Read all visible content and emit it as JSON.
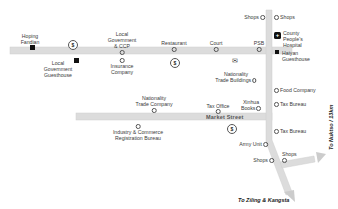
{
  "colors": {
    "road": "#dcdcdc",
    "road_border": "#c8c8c8",
    "text": "#3a3a3a",
    "symbol": "#111111"
  },
  "streets": {
    "market_street": "Market Street"
  },
  "destinations": {
    "east": "To Nuktso / 13km",
    "south": "To Ziling & Kangsta"
  },
  "places": {
    "hoping_fandian": "Hoping\nFandian",
    "local_gov_guesthouse": "Local\nGovernment\nGuesthouse",
    "local_gov_ccp": "Local\nGovernment\n& CCP",
    "insurance_company": "Insurance\nCompany",
    "restaurant": "Restaurant",
    "court": "Court",
    "psb": "PSB",
    "shops_top_left": "Shops",
    "shops_top_right": "Shops",
    "county_hospital": "County\nPeople's\nHospital",
    "haiyan_guesthouse": "Haiyan\nGuesthouse",
    "nationality_trade_buildings": "Nationality\nTrade Buildings",
    "food_company": "Food Company",
    "nationality_trade_company": "Nationality\nTrade Company",
    "tax_office": "Tax Office",
    "xinhua_books": "Xinhua\nBooks",
    "tax_bureau_1": "Tax Bureau",
    "tax_bureau_2": "Tax Bureau",
    "industry_commerce": "Industry & Commerce\nRegistration Bureau",
    "army_unit": "Army Unit",
    "shops_bottom_left": "Shops",
    "shops_bottom_right": "Shops"
  },
  "icons": {
    "bank": "$",
    "post": "✉",
    "hospital": "+"
  }
}
